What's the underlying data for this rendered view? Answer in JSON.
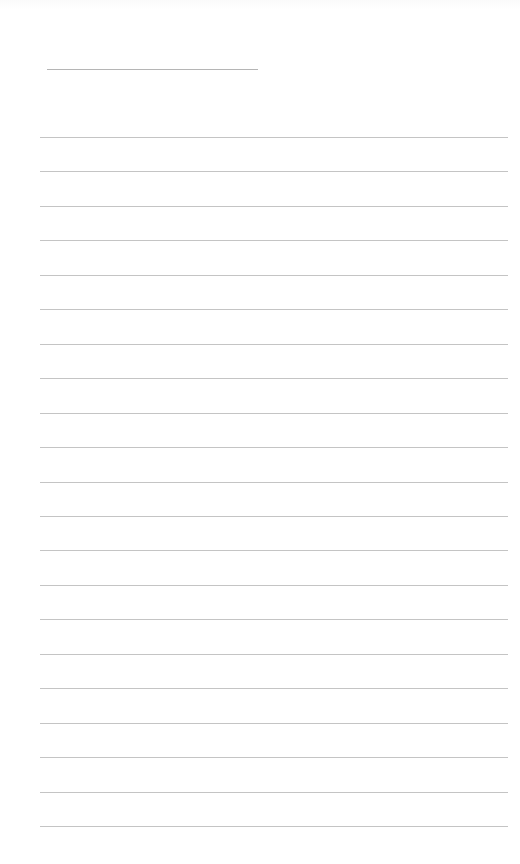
{
  "page": {
    "type": "blank lined writing page",
    "background_color": "#ffffff",
    "line_color": "#c4c4c4",
    "title_line": {
      "x": 47,
      "y": 69,
      "width": 211
    },
    "ruled_lines": {
      "count": 21,
      "x": 40,
      "width": 468,
      "first_y": 137,
      "last_y": 826
    },
    "text_content": ""
  }
}
